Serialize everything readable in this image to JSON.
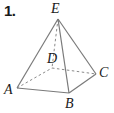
{
  "problem": {
    "number": "1."
  },
  "figure": {
    "type": "square-pyramid",
    "stroke_color": "#7a7a7a",
    "label_color": "#1a1a1a",
    "background_color": "#ffffff",
    "vertices": [
      {
        "id": "E",
        "label": "E",
        "role": "apex",
        "x": 58,
        "y": 19,
        "hidden": false
      },
      {
        "id": "A",
        "label": "A",
        "role": "base-corner",
        "x": 17,
        "y": 88,
        "hidden": false
      },
      {
        "id": "B",
        "label": "B",
        "role": "base-corner",
        "x": 69,
        "y": 93,
        "hidden": false
      },
      {
        "id": "C",
        "label": "C",
        "role": "base-corner",
        "x": 96,
        "y": 74,
        "hidden": false
      },
      {
        "id": "D",
        "label": "D",
        "role": "base-corner",
        "x": 52,
        "y": 68,
        "hidden": true
      }
    ],
    "edges": [
      {
        "from": "E",
        "to": "A",
        "style": "solid"
      },
      {
        "from": "E",
        "to": "B",
        "style": "solid"
      },
      {
        "from": "E",
        "to": "C",
        "style": "solid"
      },
      {
        "from": "E",
        "to": "D",
        "style": "dashed"
      },
      {
        "from": "A",
        "to": "B",
        "style": "solid"
      },
      {
        "from": "B",
        "to": "C",
        "style": "solid"
      },
      {
        "from": "A",
        "to": "D",
        "style": "dashed"
      },
      {
        "from": "D",
        "to": "C",
        "style": "dashed"
      }
    ],
    "labels": {
      "E": "E",
      "D": "D",
      "A": "A",
      "C": "C",
      "B": "B"
    }
  }
}
